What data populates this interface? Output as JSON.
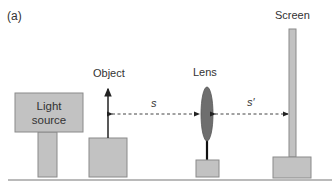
{
  "panel_label": "(a)",
  "components": {
    "light_source": {
      "line1": "Light",
      "line2": "source"
    },
    "object": {
      "label": "Object"
    },
    "lens": {
      "label": "Lens"
    },
    "screen": {
      "label": "Screen"
    }
  },
  "distances": {
    "object_distance": "s",
    "image_distance": "s′"
  },
  "colors": {
    "block_fill": "#c2c2c2",
    "block_stroke": "#8a8a8a",
    "lens_fill": "#6e6e6e",
    "line": "#333333",
    "ground": "#777777"
  }
}
